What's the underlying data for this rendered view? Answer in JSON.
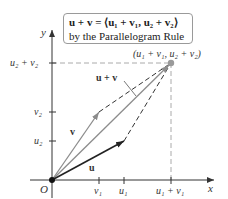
{
  "caption": {
    "line1": "u + v = ⟨u₁ + v₁, u₂ + v₂⟩",
    "line2": "by the Parallelogram Rule"
  },
  "axes": {
    "x_label": "x",
    "y_label": "y",
    "origin_label": "O"
  },
  "x_ticks": [
    {
      "label": "v₁"
    },
    {
      "label": "u₁"
    },
    {
      "label": "u₁ + v₁"
    }
  ],
  "y_ticks": [
    {
      "label": "u₂"
    },
    {
      "label": "v₂"
    },
    {
      "label": "u₂ + v₂"
    }
  ],
  "vectors": {
    "u": {
      "label": "u",
      "color": "#222222"
    },
    "v": {
      "label": "v",
      "color": "#8c8c8c"
    },
    "sum": {
      "label": "u + v",
      "color": "#8c8c8c"
    }
  },
  "point_label": "(u₁ + v₁, u₂ + v₂)",
  "colors": {
    "axis": "#333333",
    "dashed": "#333333",
    "guide": "#aaaaaa",
    "point": "#9a9a9a"
  }
}
